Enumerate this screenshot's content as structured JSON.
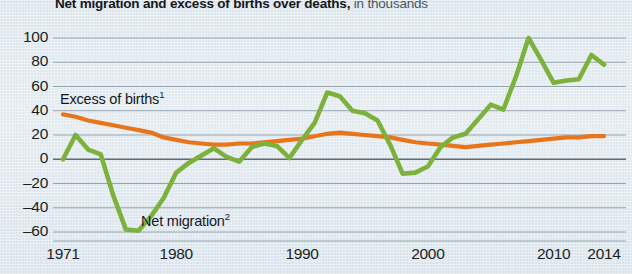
{
  "title": {
    "main": "Net migration and excess of births over deaths,",
    "subtitle": "in thousands"
  },
  "colors": {
    "net_migration": "#7CB23C",
    "excess_of_births": "#E8751A",
    "grid": "#8a99a6",
    "axis": "#4f5d68",
    "background": "#dfe8ee",
    "text": "#15191d"
  },
  "labels": {
    "excess_of_births": "Excess of births",
    "excess_of_births_note": "1",
    "net_migration": "Net migration",
    "net_migration_note": "2"
  },
  "axes": {
    "y_ticks": [
      "100",
      "80",
      "60",
      "40",
      "20",
      "0",
      "–20",
      "–40",
      "–60"
    ],
    "x_ticks": [
      "1971",
      "1980",
      "1990",
      "2000",
      "2010",
      "2014"
    ]
  },
  "chart_data": {
    "type": "line",
    "title": "Net migration and excess of births over deaths, in thousands",
    "xlabel": "",
    "ylabel": "in thousands",
    "ylim": [
      -65,
      105
    ],
    "xlim": [
      1971,
      2014
    ],
    "grid": true,
    "legend": "inline-annotations",
    "x": [
      1971,
      1972,
      1973,
      1974,
      1975,
      1976,
      1977,
      1978,
      1979,
      1980,
      1981,
      1982,
      1983,
      1984,
      1985,
      1986,
      1987,
      1988,
      1989,
      1990,
      1991,
      1992,
      1993,
      1994,
      1995,
      1996,
      1997,
      1998,
      1999,
      2000,
      2001,
      2002,
      2003,
      2004,
      2005,
      2006,
      2007,
      2008,
      2009,
      2010,
      2011,
      2012,
      2013,
      2014
    ],
    "series": [
      {
        "name": "Net migration",
        "color": "#7CB23C",
        "values": [
          0,
          20,
          8,
          4,
          -30,
          -58,
          -59,
          -47,
          -32,
          -11,
          -3,
          3,
          9,
          2,
          -2,
          10,
          13,
          11,
          1,
          16,
          30,
          55,
          52,
          40,
          38,
          32,
          12,
          -12,
          -11,
          -6,
          10,
          18,
          21,
          33,
          45,
          41,
          68,
          100,
          82,
          63,
          65,
          66,
          86,
          78
        ]
      },
      {
        "name": "Excess of births",
        "color": "#E8751A",
        "values": [
          37,
          35,
          32,
          30,
          28,
          26,
          24,
          22,
          18,
          16,
          14,
          13,
          12,
          12,
          13,
          13,
          14,
          15,
          16,
          17,
          19,
          21,
          22,
          21,
          20,
          19,
          18,
          16,
          14,
          13,
          12,
          11,
          10,
          11,
          12,
          13,
          14,
          15,
          16,
          17,
          18,
          18,
          19,
          19
        ]
      }
    ]
  }
}
